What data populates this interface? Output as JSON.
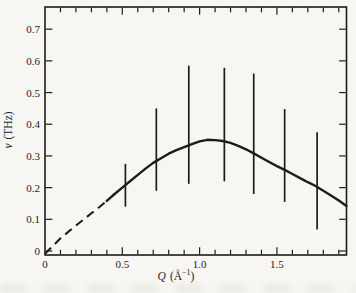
{
  "figure": {
    "background": "#f7f6f2",
    "ink": "#1d1c1a"
  },
  "chart_data": {
    "type": "line",
    "title": "",
    "xlabel": "Q (Å−1)",
    "ylabel": "ν (THz)",
    "grid": false,
    "legend": null,
    "x_axis": {
      "label_var": "Q",
      "label_unit_open": "(Å",
      "label_unit_sup": "−1",
      "label_unit_close": ")",
      "min": 0,
      "max": 1.95,
      "minor_tick_step": 0.1,
      "tick_values": [
        0,
        0.5,
        1.0,
        1.5
      ],
      "tick_labels": [
        "0",
        "0.5",
        "1.0",
        "1.5"
      ]
    },
    "y_axis": {
      "label_var": "ν",
      "label_unit": "(THz)",
      "min": 0,
      "max": 0.77,
      "tick_values": [
        0.7,
        0.6,
        0.5,
        0.4,
        0.3,
        0.2,
        0.1,
        0
      ],
      "tick_labels": [
        "0.7",
        "0.6",
        "0.5",
        "0.4",
        "0.3",
        "0.2",
        "0.1",
        "0"
      ]
    },
    "curve": {
      "dash_until_q": 0.4,
      "points": [
        [
          0.0,
          0.0
        ],
        [
          0.1,
          0.04
        ],
        [
          0.2,
          0.08
        ],
        [
          0.3,
          0.119
        ],
        [
          0.35,
          0.138
        ],
        [
          0.4,
          0.158
        ],
        [
          0.45,
          0.18
        ],
        [
          0.5,
          0.2
        ],
        [
          0.55,
          0.22
        ],
        [
          0.6,
          0.24
        ],
        [
          0.65,
          0.26
        ],
        [
          0.7,
          0.278
        ],
        [
          0.75,
          0.293
        ],
        [
          0.8,
          0.307
        ],
        [
          0.85,
          0.318
        ],
        [
          0.9,
          0.328
        ],
        [
          0.95,
          0.337
        ],
        [
          1.0,
          0.346
        ],
        [
          1.05,
          0.351
        ],
        [
          1.1,
          0.35
        ],
        [
          1.15,
          0.347
        ],
        [
          1.2,
          0.341
        ],
        [
          1.25,
          0.332
        ],
        [
          1.3,
          0.321
        ],
        [
          1.35,
          0.308
        ],
        [
          1.4,
          0.294
        ],
        [
          1.45,
          0.281
        ],
        [
          1.5,
          0.268
        ],
        [
          1.55,
          0.256
        ],
        [
          1.6,
          0.243
        ],
        [
          1.65,
          0.23
        ],
        [
          1.7,
          0.217
        ],
        [
          1.75,
          0.205
        ],
        [
          1.8,
          0.19
        ],
        [
          1.85,
          0.175
        ],
        [
          1.9,
          0.159
        ],
        [
          1.95,
          0.142
        ]
      ]
    },
    "error_bars": [
      {
        "q": 0.52,
        "v_min": 0.14,
        "v_max": 0.275
      },
      {
        "q": 0.72,
        "v_min": 0.19,
        "v_max": 0.45
      },
      {
        "q": 0.93,
        "v_min": 0.212,
        "v_max": 0.585
      },
      {
        "q": 1.16,
        "v_min": 0.22,
        "v_max": 0.578
      },
      {
        "q": 1.35,
        "v_min": 0.18,
        "v_max": 0.56
      },
      {
        "q": 1.55,
        "v_min": 0.155,
        "v_max": 0.448
      },
      {
        "q": 1.76,
        "v_min": 0.068,
        "v_max": 0.375
      }
    ]
  }
}
